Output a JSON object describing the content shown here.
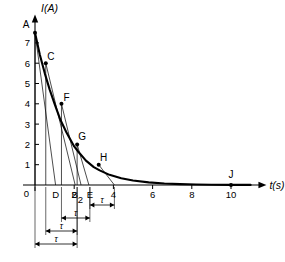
{
  "chart_data": {
    "type": "line",
    "title": "",
    "xlabel": "t(s)",
    "ylabel": "I(A)",
    "xlim": [
      0,
      11.3
    ],
    "ylim": [
      0,
      8.2
    ],
    "grid": false,
    "legend": null,
    "x_ticks": [
      0,
      2,
      4,
      6,
      8,
      10
    ],
    "x_tick_labels": [
      "0",
      "2",
      "4",
      "6",
      "8",
      "10"
    ],
    "y_ticks": [
      1,
      2,
      3,
      4,
      5,
      6,
      7
    ],
    "y_tick_labels": [
      "1",
      "2",
      "3",
      "4",
      "5",
      "6",
      "7"
    ],
    "series": [
      {
        "name": "current-decay",
        "kind": "exponential-decay",
        "I0": 7.5,
        "tau": 1.55,
        "x": [
          0.0,
          0.25,
          0.5,
          0.75,
          1.0,
          1.3,
          1.6,
          2.0,
          2.2,
          2.6,
          3.0,
          3.3,
          3.8,
          4.4,
          5.0,
          5.8,
          6.6,
          7.4,
          8.2,
          9.0,
          10.0,
          11.0
        ],
        "values": [
          7.5,
          6.4,
          5.5,
          4.7,
          4.0,
          3.2,
          2.6,
          1.9,
          1.65,
          1.2,
          0.88,
          0.72,
          0.5,
          0.33,
          0.22,
          0.13,
          0.075,
          0.045,
          0.026,
          0.016,
          0.008,
          0.004
        ]
      }
    ],
    "points": [
      {
        "label": "A",
        "x": 0.0,
        "y": 7.5,
        "label_dx": -9,
        "label_dy": -5
      },
      {
        "label": "C",
        "x": 0.55,
        "y": 6.0,
        "label_dx": 5,
        "label_dy": -3
      },
      {
        "label": "F",
        "x": 1.35,
        "y": 4.0,
        "label_dx": 5,
        "label_dy": -3
      },
      {
        "label": "G",
        "x": 2.15,
        "y": 2.0,
        "label_dx": 5,
        "label_dy": -4
      },
      {
        "label": "H",
        "x": 3.25,
        "y": 1.0,
        "label_dx": 5,
        "label_dy": -4
      },
      {
        "label": "J",
        "x": 10.0,
        "y": 0.0,
        "label_dx": 0,
        "label_dy": -7
      }
    ],
    "tangents": [
      {
        "from": "A",
        "x0": 0.0,
        "y0": 7.5,
        "x1": 1.05,
        "y1": 0.0,
        "foot_label": "D"
      },
      {
        "from": "C",
        "x0": 0.55,
        "y0": 6.0,
        "x1": 2.05,
        "y1": 0.0,
        "foot_label": "B"
      },
      {
        "from": "F",
        "x0": 1.35,
        "y0": 4.0,
        "x1": 2.35,
        "y1": 0.0,
        "foot_label": "2"
      },
      {
        "from": "G",
        "x0": 2.15,
        "y0": 2.0,
        "x1": 2.75,
        "y1": 0.0,
        "foot_label": "E"
      },
      {
        "from": "H",
        "x0": 3.25,
        "y0": 1.0,
        "x1": 4.05,
        "y1": 0.0,
        "foot_label": "4"
      }
    ],
    "axis_foot_labels": [
      {
        "label": "D",
        "x": 1.05
      },
      {
        "label": "B",
        "x": 2.02
      },
      {
        "label": "2",
        "x": 2.32
      },
      {
        "label": "E",
        "x": 2.8
      }
    ],
    "drop_lines": [
      {
        "x": 0.0,
        "y": 7.5
      },
      {
        "x": 0.55,
        "y": 6.0
      },
      {
        "x": 1.35,
        "y": 4.0
      },
      {
        "x": 2.15,
        "y": 2.0
      }
    ],
    "tau_brackets": [
      {
        "symbol": "τ",
        "x_start": 2.8,
        "x_end": 4.05,
        "row": 0
      },
      {
        "symbol": "τ",
        "x_start": 1.35,
        "x_end": 2.8,
        "row": 1
      },
      {
        "symbol": "τ",
        "x_start": 0.55,
        "x_end": 2.15,
        "row": 2
      },
      {
        "symbol": "τ",
        "x_start": 0.0,
        "x_end": 2.15,
        "row": 3
      }
    ]
  },
  "style": {
    "curve_color": "#000000",
    "axis_color": "#000000",
    "tangent_color": "#000000",
    "background": "#ffffff"
  }
}
